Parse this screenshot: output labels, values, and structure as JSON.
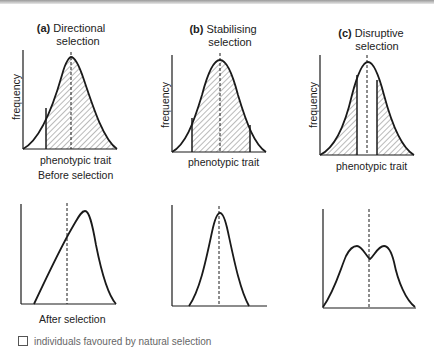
{
  "panels": [
    {
      "id": "a",
      "letter": "(a)",
      "title_line1": "Directional",
      "title_line2": "selection",
      "ylabel": "frequency",
      "xlabel": "phenotypic trait"
    },
    {
      "id": "b",
      "letter": "(b)",
      "title_line1": "Stabilising",
      "title_line2": "selection",
      "ylabel": "frequency",
      "xlabel": "phenotypic trait"
    },
    {
      "id": "c",
      "letter": "(c)",
      "title_line1": "Disruptive",
      "title_line2": "selection",
      "ylabel": "frequency",
      "xlabel": "phenotypic trait"
    }
  ],
  "row_labels": {
    "before": "Before selection",
    "after": "After selection"
  },
  "legend": {
    "text": "individuals favoured by natural selection"
  },
  "colors": {
    "line": "#1a1a1a",
    "hatch": "#555555",
    "background": "#ffffff"
  }
}
